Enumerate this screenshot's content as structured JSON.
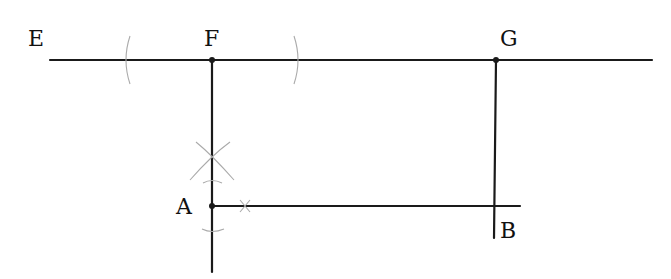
{
  "diagram": {
    "type": "geometric-construction",
    "points": [
      {
        "label": "E",
        "x": 42,
        "y": 48
      },
      {
        "label": "F",
        "x": 212,
        "y": 60
      },
      {
        "label": "G",
        "x": 496,
        "y": 60
      },
      {
        "label": "A",
        "x": 212,
        "y": 206
      },
      {
        "label": "B",
        "x": 496,
        "y": 206
      }
    ],
    "labels": {
      "E": "E",
      "F": "F",
      "G": "G",
      "A": "A",
      "B": "B"
    },
    "segments": [
      {
        "name": "line-EG",
        "from": [
          50,
          60
        ],
        "to": [
          652,
          60
        ]
      },
      {
        "name": "perpendicular-through-A",
        "from": [
          212,
          60
        ],
        "to": [
          212,
          272
        ]
      },
      {
        "name": "segment-AB",
        "from": [
          212,
          206
        ],
        "to": [
          520,
          206
        ]
      },
      {
        "name": "perpendicular-from-G",
        "from": [
          496,
          60
        ],
        "to": [
          494,
          238
        ]
      }
    ],
    "construction_arcs": [
      "arc-left-of-F",
      "arc-right-of-F",
      "arc-cross-above-A",
      "arc-above-A",
      "arc-below-A",
      "arc-tick-on-AB"
    ],
    "colors": {
      "line": "#1a1a1a",
      "construction": "#aaaaaa",
      "background": "#ffffff"
    }
  }
}
